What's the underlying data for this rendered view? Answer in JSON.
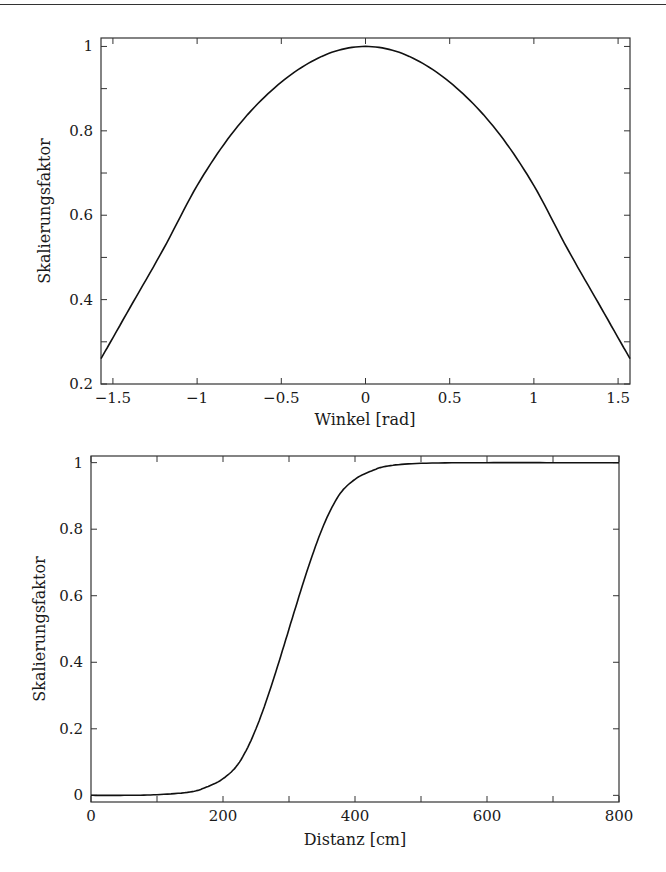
{
  "chart_data": [
    {
      "type": "line",
      "title": "",
      "xlabel": "Winkel [rad]",
      "ylabel": "Skalierungsfaktor",
      "xlim": [
        -1.5708,
        1.5708
      ],
      "ylim": [
        0.2,
        1.02
      ],
      "grid": false,
      "legend": null,
      "xticks": [
        -1.5,
        -1,
        -0.5,
        0,
        0.5,
        1,
        1.5
      ],
      "xtick_labels": [
        "−1.5",
        "−1",
        "−0.5",
        "0",
        "0.5",
        "1",
        "1.5"
      ],
      "yticks": [
        0.2,
        0.4,
        0.6,
        0.8,
        1
      ],
      "ytick_labels": [
        "0.2",
        "0.4",
        "0.6",
        "0.8",
        "1"
      ],
      "series": [
        {
          "name": "Skalierungsfaktor",
          "x": [
            -1.5708,
            -1.4,
            -1.2,
            -1.0,
            -0.8,
            -0.6,
            -0.4,
            -0.2,
            0,
            0.2,
            0.4,
            0.6,
            0.8,
            1.0,
            1.2,
            1.4,
            1.5708
          ],
          "y": [
            0.26,
            0.38,
            0.52,
            0.67,
            0.79,
            0.88,
            0.945,
            0.986,
            1.0,
            0.986,
            0.945,
            0.88,
            0.79,
            0.67,
            0.52,
            0.38,
            0.26
          ]
        }
      ]
    },
    {
      "type": "line",
      "title": "",
      "xlabel": "Distanz [cm]",
      "ylabel": "Skalierungsfaktor",
      "xlim": [
        0,
        800
      ],
      "ylim": [
        -0.02,
        1.02
      ],
      "grid": false,
      "legend": null,
      "xticks": [
        0,
        200,
        400,
        600,
        800
      ],
      "xtick_labels": [
        "0",
        "200",
        "400",
        "600",
        "800"
      ],
      "xminor_ticks": [
        100,
        300,
        500,
        700
      ],
      "yticks": [
        0,
        0.2,
        0.4,
        0.6,
        0.8,
        1
      ],
      "ytick_labels": [
        "0",
        "0.2",
        "0.4",
        "0.6",
        "0.8",
        "1"
      ],
      "series": [
        {
          "name": "Skalierungsfaktor",
          "x": [
            0,
            50,
            100,
            150,
            175,
            200,
            225,
            250,
            275,
            300,
            325,
            350,
            375,
            400,
            425,
            450,
            500,
            600,
            700,
            800
          ],
          "y": [
            0.0,
            0.0,
            0.002,
            0.01,
            0.025,
            0.05,
            0.1,
            0.2,
            0.34,
            0.5,
            0.66,
            0.8,
            0.9,
            0.95,
            0.975,
            0.99,
            0.998,
            1.0,
            1.0,
            1.0
          ]
        }
      ]
    }
  ]
}
